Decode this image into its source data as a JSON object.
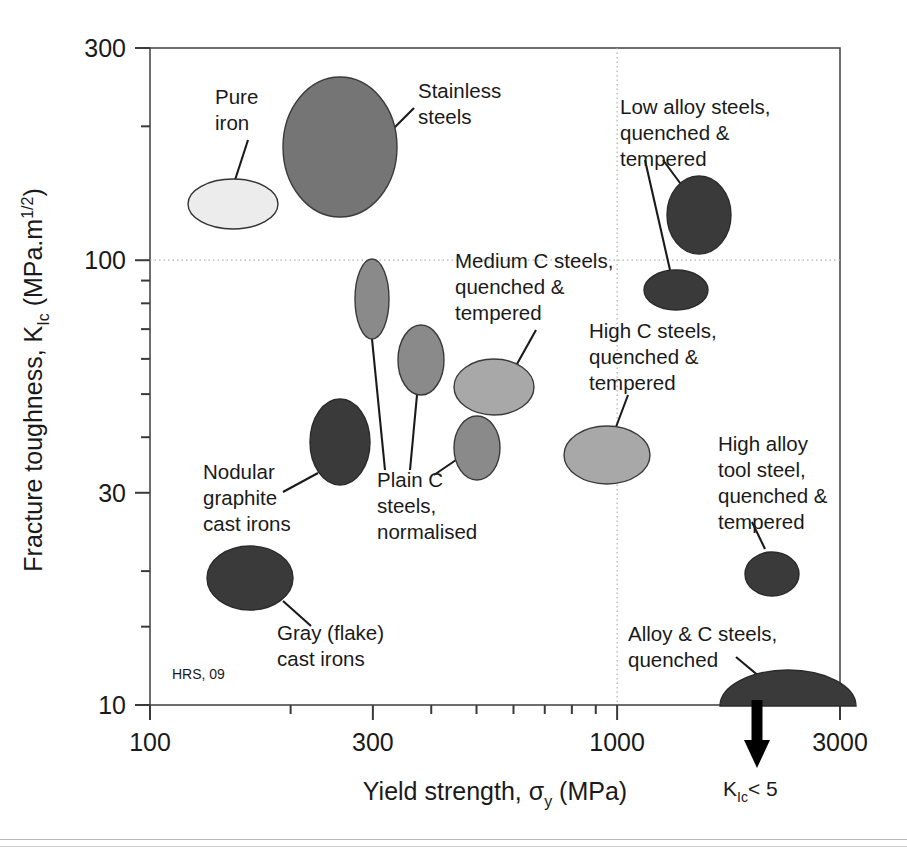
{
  "figure": {
    "credit": "HRS, 09",
    "note_klc": "K",
    "note_klc_sub": "Ic",
    "note_klc_rest": "< 5"
  },
  "axes": {
    "x": {
      "title_main": "Yield strength, ",
      "title_symbol": "σ",
      "title_sub": "y",
      "title_units": "  (MPa)",
      "ticks": [
        {
          "value": 100,
          "label": "100",
          "major": true
        },
        {
          "value": 200,
          "label": "",
          "major": false
        },
        {
          "value": 300,
          "label": "300",
          "major": true
        },
        {
          "value": 400,
          "label": "",
          "major": false
        },
        {
          "value": 500,
          "label": "",
          "major": false
        },
        {
          "value": 600,
          "label": "",
          "major": false
        },
        {
          "value": 700,
          "label": "",
          "major": false
        },
        {
          "value": 800,
          "label": "",
          "major": false
        },
        {
          "value": 900,
          "label": "",
          "major": false
        },
        {
          "value": 1000,
          "label": "1000",
          "major": true
        },
        {
          "value": 2000,
          "label": "",
          "major": false
        },
        {
          "value": 3000,
          "label": "3000",
          "major": true
        }
      ],
      "min": 100,
      "max": 3000,
      "scale": "log",
      "gridlines": [
        1000
      ]
    },
    "y": {
      "title_main": "Fracture toughness, K",
      "title_sub": "Ic",
      "title_units": "  (MPa.m",
      "title_sup": "1/2",
      "title_tail": ")",
      "ticks": [
        {
          "value": 10,
          "label": "10",
          "major": true
        },
        {
          "value": 15,
          "label": "",
          "major": false
        },
        {
          "value": 20,
          "label": "",
          "major": false
        },
        {
          "value": 30,
          "label": "30",
          "major": true
        },
        {
          "value": 40,
          "label": "",
          "major": false
        },
        {
          "value": 50,
          "label": "",
          "major": false
        },
        {
          "value": 60,
          "label": "",
          "major": false
        },
        {
          "value": 70,
          "label": "",
          "major": false
        },
        {
          "value": 80,
          "label": "",
          "major": false
        },
        {
          "value": 90,
          "label": "",
          "major": false
        },
        {
          "value": 100,
          "label": "100",
          "major": true
        },
        {
          "value": 200,
          "label": "",
          "major": false
        },
        {
          "value": 300,
          "label": "300",
          "major": true
        }
      ],
      "min": 10,
      "max": 300,
      "scale": "log",
      "gridlines": [
        100
      ]
    }
  },
  "chart_data": {
    "type": "scatter",
    "title": "",
    "xlabel": "Yield strength, σy  (MPa)",
    "ylabel": "Fracture toughness, KIc  (MPa.m1/2)",
    "xscale": "log",
    "yscale": "log",
    "xlim": [
      100,
      3000
    ],
    "ylim": [
      10,
      300
    ],
    "grid": "dotted at x=1000 and y=100",
    "legend": "none (direct labels with leader lines)",
    "annotation": "KIc < 5 (downward arrow below Alloy & C steels, quenched)",
    "credit": "HRS, 09",
    "bubbles": [
      {
        "name": "Pure iron",
        "label_lines": [
          "Pure",
          "iron"
        ],
        "fill": "#ececec",
        "stroke": "#333333",
        "x_range": [
          135,
          225
        ],
        "y_range": [
          130,
          190
        ],
        "x_center": 174,
        "y_center": 157,
        "px": {
          "cx": 233,
          "cy": 204,
          "rx": 45,
          "ry": 25,
          "rot": 0
        },
        "label_px": {
          "x": 215,
          "y": 104
        },
        "leader": [
          [
            248,
            140
          ],
          [
            235,
            180
          ]
        ]
      },
      {
        "name": "Stainless steels",
        "label_lines": [
          "Stainless",
          "steels"
        ],
        "fill": "#757575",
        "stroke": "#3a3a3a",
        "x_range": [
          220,
          330
        ],
        "y_range": [
          135,
          245
        ],
        "x_center": 270,
        "y_center": 182,
        "px": {
          "cx": 340,
          "cy": 147,
          "rx": 57,
          "ry": 70,
          "rot": 0
        },
        "label_px": {
          "x": 418,
          "y": 98
        },
        "leader": [
          [
            392,
            130
          ],
          [
            414,
            108
          ]
        ]
      },
      {
        "name": "Low alloy steels, quenched & tempered",
        "label_lines": [
          "Low alloy steels,",
          "quenched &",
          "tempered"
        ],
        "fill": "#3a3a3a",
        "stroke": "#2a2a2a",
        "x_range": [
          1200,
          1800
        ],
        "y_range": [
          105,
          145
        ],
        "x_center": 1480,
        "y_center": 123,
        "px": {
          "cx": 699,
          "cy": 215,
          "rx": 32,
          "ry": 39,
          "rot": 0
        },
        "label_px": {
          "x": 620,
          "y": 114
        },
        "leader": [
          [
            683,
            187
          ],
          [
            663,
            160
          ]
        ]
      },
      {
        "name": "Low alloy steels second bubble",
        "label_lines": [],
        "fill": "#3a3a3a",
        "stroke": "#2a2a2a",
        "x_range": [
          1150,
          1600
        ],
        "y_range": [
          80,
          100
        ],
        "x_center": 1350,
        "y_center": 89,
        "px": {
          "cx": 676,
          "cy": 290,
          "rx": 32,
          "ry": 20,
          "rot": 0
        },
        "label_px": null,
        "leader": [
          [
            670,
            270
          ],
          [
            645,
            160
          ]
        ]
      },
      {
        "name": "Plain C steels, normalised (tall)",
        "label_lines": [
          "Plain C",
          "steels,",
          "normalised"
        ],
        "fill": "#8a8a8a",
        "stroke": "#3a3a3a",
        "x_range": [
          285,
          320
        ],
        "y_range": [
          62,
          100
        ],
        "x_center": 300,
        "y_center": 79,
        "px": {
          "cx": 372,
          "cy": 299,
          "rx": 17,
          "ry": 40,
          "rot": 0
        },
        "label_px": {
          "x": 377,
          "y": 487
        },
        "leader": [
          [
            372,
            339
          ],
          [
            385,
            470
          ]
        ]
      },
      {
        "name": "Plain C steels, normalised (mid)",
        "label_lines": [],
        "fill": "#8a8a8a",
        "stroke": "#3a3a3a",
        "x_range": [
          330,
          380
        ],
        "y_range": [
          52,
          74
        ],
        "x_center": 355,
        "y_center": 62,
        "px": {
          "cx": 421,
          "cy": 360,
          "rx": 23,
          "ry": 35,
          "rot": 0
        },
        "label_px": null,
        "leader": [
          [
            417,
            395
          ],
          [
            410,
            470
          ]
        ]
      },
      {
        "name": "Plain C steels, normalised (low)",
        "label_lines": [],
        "fill": "#8a8a8a",
        "stroke": "#3a3a3a",
        "x_range": [
          400,
          470
        ],
        "y_range": [
          31,
          42
        ],
        "x_center": 435,
        "y_center": 36,
        "px": {
          "cx": 477,
          "cy": 448,
          "rx": 23,
          "ry": 32,
          "rot": 0
        },
        "label_px": null,
        "leader": [
          [
            456,
            460
          ],
          [
            434,
            475
          ]
        ]
      },
      {
        "name": "Medium C steels, quenched & tempered",
        "label_lines": [
          "Medium C steels,",
          "quenched &",
          "tempered"
        ],
        "fill": "#a8a8a8",
        "stroke": "#3a3a3a",
        "x_range": [
          400,
          530
        ],
        "y_range": [
          40,
          56
        ],
        "x_center": 460,
        "y_center": 47,
        "px": {
          "cx": 494,
          "cy": 387,
          "rx": 40,
          "ry": 28,
          "rot": 0
        },
        "label_px": {
          "x": 455,
          "y": 268
        },
        "leader": [
          [
            517,
            364
          ],
          [
            536,
            330
          ]
        ]
      },
      {
        "name": "High C steels, quenched & tempered",
        "label_lines": [
          "High C steels,",
          "quenched &",
          "tempered"
        ],
        "fill": "#a8a8a8",
        "stroke": "#3a3a3a",
        "x_range": [
          800,
          1100
        ],
        "y_range": [
          31,
          41
        ],
        "x_center": 940,
        "y_center": 36,
        "px": {
          "cx": 607,
          "cy": 455,
          "rx": 43,
          "ry": 29,
          "rot": 0
        },
        "label_px": {
          "x": 589,
          "y": 338
        },
        "leader": [
          [
            616,
            427
          ],
          [
            628,
            395
          ]
        ]
      },
      {
        "name": "Nodular graphite cast irons",
        "label_lines": [
          "Nodular",
          "graphite",
          "cast irons"
        ],
        "fill": "#3a3a3a",
        "stroke": "#2a2a2a",
        "x_range": [
          230,
          290
        ],
        "y_range": [
          32,
          46
        ],
        "x_center": 258,
        "y_center": 38,
        "px": {
          "cx": 340,
          "cy": 442,
          "rx": 30,
          "ry": 43,
          "rot": 0
        },
        "label_px": {
          "x": 203,
          "y": 479
        },
        "leader": [
          [
            318,
            473
          ],
          [
            283,
            492
          ]
        ]
      },
      {
        "name": "Gray (flake) cast irons",
        "label_lines": [
          "Gray (flake)",
          "cast irons"
        ],
        "fill": "#3a3a3a",
        "stroke": "#2a2a2a",
        "x_range": [
          155,
          250
        ],
        "y_range": [
          16,
          23
        ],
        "x_center": 197,
        "y_center": 19,
        "px": {
          "cx": 250,
          "cy": 578,
          "rx": 43,
          "ry": 32,
          "rot": 0
        },
        "label_px": {
          "x": 277,
          "y": 640
        },
        "leader": [
          [
            283,
            601
          ],
          [
            311,
            626
          ]
        ]
      },
      {
        "name": "High alloy tool steel, quenched & tempered",
        "label_lines": [
          "High alloy",
          "tool steel,",
          "quenched &",
          "tempered"
        ],
        "fill": "#3a3a3a",
        "stroke": "#2a2a2a",
        "x_range": [
          1500,
          1900
        ],
        "y_range": [
          17,
          20
        ],
        "x_center": 1700,
        "y_center": 18,
        "px": {
          "cx": 772,
          "cy": 574,
          "rx": 27,
          "ry": 22,
          "rot": 0
        },
        "label_px": {
          "x": 718,
          "y": 451
        },
        "leader": [
          [
            765,
            549
          ],
          [
            752,
            522
          ]
        ]
      },
      {
        "name": "Alloy & C steels, quenched",
        "label_lines": [
          "Alloy & C steels,",
          "quenched"
        ],
        "fill": "#3a3a3a",
        "stroke": "#2a2a2a",
        "shape": "half-dome",
        "x_range": [
          1650,
          3000
        ],
        "y_range": [
          10,
          13
        ],
        "x_center": 2300,
        "y_center": 10,
        "px": {
          "cx": 788,
          "cy": 706,
          "rx": 68,
          "ry": 36,
          "rot": 0
        },
        "label_px": {
          "x": 628,
          "y": 641
        },
        "leader": [
          [
            736,
            657
          ],
          [
            766,
            682
          ]
        ]
      }
    ]
  }
}
